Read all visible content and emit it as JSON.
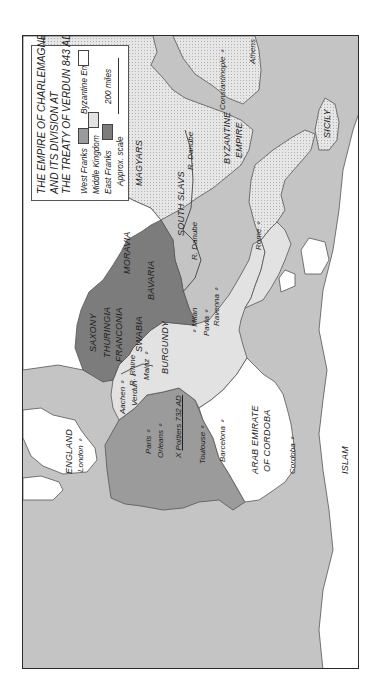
{
  "map": {
    "title_lines": [
      "THE EMPIRE OF CHARLEMAGNE",
      "AND ITS DIVISION AT",
      "THE TREATY OF VERDUN 843 AD"
    ],
    "orientation": "rotated 90 degrees counter-clockwise",
    "legend": {
      "items": [
        {
          "label": "West Franks",
          "color": "#9b9b9b"
        },
        {
          "label": "Middle Kingdom",
          "color": "#e2e2e2"
        },
        {
          "label": "East Franks",
          "color": "#7c7c7c"
        },
        {
          "label": "Byzantine Empire",
          "color": "#ffffff"
        }
      ],
      "scale_label": "200 miles",
      "scale_note": "Approx. scale"
    },
    "colors": {
      "sea": "#c4c4c4",
      "unclaimed_land": "#ffffff",
      "west_franks": "#9b9b9b",
      "middle_kingdom": "#e2e2e2",
      "east_franks": "#7c7c7c",
      "byzantine": "#dedede",
      "frame": "#2a2a2a"
    },
    "regions": {
      "england": "ENGLAND",
      "saxony": "SAXONY",
      "thuringia": "THURINGIA",
      "franconia": "FRANCONIA",
      "swabia": "SWABIA",
      "bavaria": "BAVARIA",
      "moravia": "MORAVIA",
      "magyars": "MAGYARS",
      "south_slavs": "SOUTH SLAVS",
      "burgundy": "BURGUNDY",
      "byzantine_line1": "BYZANTINE",
      "byzantine_line2": "EMPIRE",
      "sicily": "SICILY",
      "arab_line1": "ARAB EMIRATE",
      "arab_line2": "OF CORDOBA",
      "islam": "ISLAM"
    },
    "cities": {
      "london": "London",
      "paris": "Paris",
      "orleans": "Orleans",
      "toulouse": "Toulouse",
      "barcelona": "Barcelona",
      "aachen": "Aachen",
      "verdun": "Verdun",
      "mainz": "Mainz",
      "milan": "Milan",
      "pavia": "Pavia",
      "ravenna": "Ravenna",
      "rome": "Rome",
      "constantinople": "Constantinople",
      "athens": "Athens",
      "cordoba": "Cordoba"
    },
    "battle": {
      "marker": "X",
      "label": "Poitiers 732 AD"
    },
    "rivers": {
      "rhine": "R. Rhine",
      "danube_west": "R. Danube",
      "danube_east": "R. Danube"
    }
  }
}
